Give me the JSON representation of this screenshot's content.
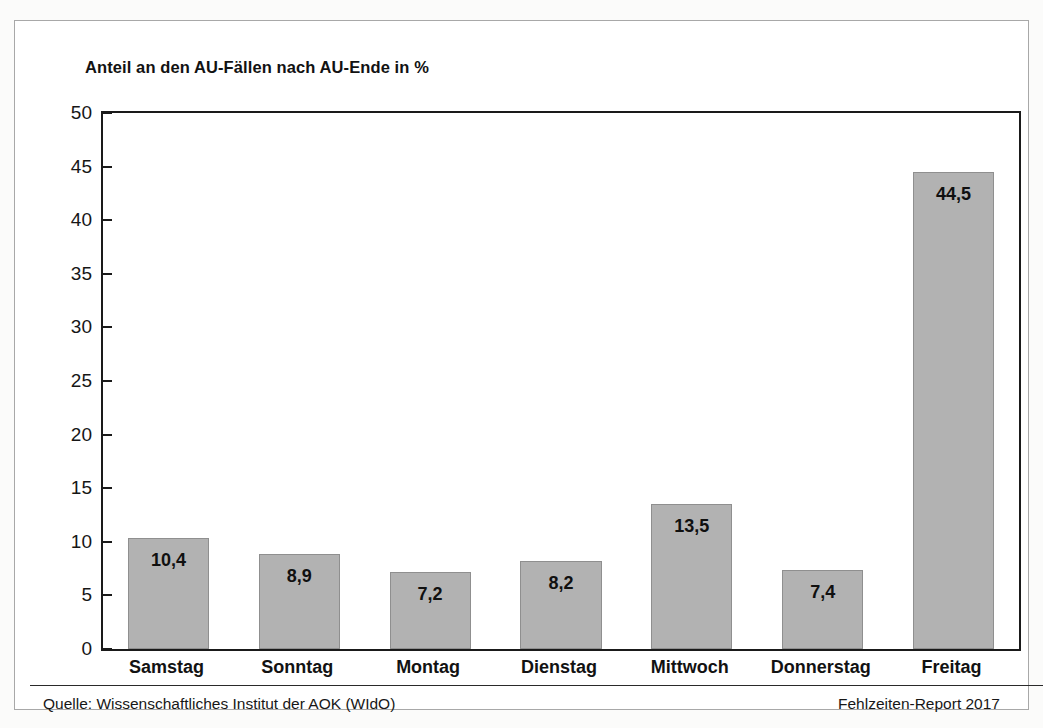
{
  "figure": {
    "title": "Anteil an den AU-Fällen nach AU-Ende in %",
    "source_label": "Quelle: Wissenschaftliches Institut der AOK (WIdO)",
    "report_label": "Fehlzeiten-Report 2017",
    "bar_color": "#b2b2b2",
    "bar_border_color": "#8f8f8f",
    "axis_color": "#1a1a1a",
    "text_color": "#121212",
    "panel_background": "#ffffff"
  },
  "chart_data": {
    "type": "bar",
    "title": "Anteil an den AU-Fällen nach AU-Ende in %",
    "xlabel": "",
    "ylabel": "",
    "ylim": [
      0,
      50
    ],
    "yticks": [
      0,
      5,
      10,
      15,
      20,
      25,
      30,
      35,
      40,
      45,
      50
    ],
    "ytick_labels": [
      "0",
      "5",
      "10",
      "15",
      "20",
      "25",
      "30",
      "35",
      "40",
      "45",
      "50"
    ],
    "grid": false,
    "legend": null,
    "categories": [
      "Samstag",
      "Sonntag",
      "Montag",
      "Dienstag",
      "Mittwoch",
      "Donnerstag",
      "Freitag"
    ],
    "values": [
      10.4,
      8.9,
      7.2,
      8.2,
      13.5,
      7.4,
      44.5
    ],
    "value_labels": [
      "10,4",
      "8,9",
      "7,2",
      "8,2",
      "13,5",
      "7,4",
      "44,5"
    ]
  }
}
